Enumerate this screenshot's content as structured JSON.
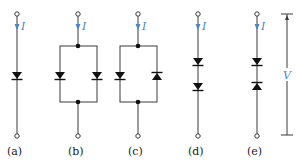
{
  "figure": {
    "colors": {
      "wire": "#3a3a3a",
      "diode": "#111111",
      "annotation": "#4a86c5",
      "background": "#ffffff"
    },
    "current_symbol": "I",
    "voltage_symbol": "V",
    "circuits": [
      {
        "id": "a",
        "label": "(a)",
        "description": "single diode, forward (pointing down)",
        "current_label": "I"
      },
      {
        "id": "b",
        "label": "(b)",
        "description": "two diodes in parallel, both pointing down",
        "current_label": "I"
      },
      {
        "id": "c",
        "label": "(c)",
        "description": "two diodes in anti-parallel (left down, right up)",
        "current_label": "I"
      },
      {
        "id": "d",
        "label": "(d)",
        "description": "two diodes in series, both pointing down",
        "current_label": "I"
      },
      {
        "id": "e",
        "label": "(e)",
        "description": "two diodes in series back-to-back (top down, bottom up) with voltage V across",
        "current_label": "I",
        "voltage_label": "V"
      }
    ]
  }
}
